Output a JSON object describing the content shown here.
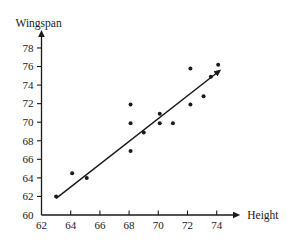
{
  "chart_data": {
    "type": "scatter",
    "title": "",
    "xlabel": "Height",
    "ylabel": "Wingspan",
    "xlim": [
      62,
      75.2
    ],
    "ylim": [
      60,
      79.3
    ],
    "xticks": [
      62,
      64,
      66,
      68,
      70,
      72,
      74
    ],
    "yticks": [
      60,
      62,
      64,
      66,
      68,
      70,
      72,
      74,
      76,
      78
    ],
    "xtick_labels": [
      "62",
      "64",
      "66",
      "68",
      "70",
      "72",
      "74"
    ],
    "ytick_labels": [
      "60",
      "62",
      "64",
      "66",
      "68",
      "70",
      "72",
      "74",
      "76",
      "78"
    ],
    "grid": false,
    "legend": null,
    "point_color": "#1a1a1a",
    "line_color": "#1a1a1a",
    "points": [
      {
        "x": 63.0,
        "y": 62.0
      },
      {
        "x": 64.1,
        "y": 64.5
      },
      {
        "x": 65.1,
        "y": 64.0
      },
      {
        "x": 68.1,
        "y": 71.9
      },
      {
        "x": 68.1,
        "y": 69.9
      },
      {
        "x": 68.1,
        "y": 66.9
      },
      {
        "x": 69.0,
        "y": 68.9
      },
      {
        "x": 70.1,
        "y": 70.9
      },
      {
        "x": 70.1,
        "y": 69.9
      },
      {
        "x": 71.0,
        "y": 69.9
      },
      {
        "x": 72.2,
        "y": 75.8
      },
      {
        "x": 72.2,
        "y": 71.9
      },
      {
        "x": 73.1,
        "y": 72.8
      },
      {
        "x": 73.6,
        "y": 74.9
      },
      {
        "x": 74.1,
        "y": 76.2
      }
    ],
    "trend_line": {
      "x_start": 63.0,
      "y_start": 61.8,
      "x_end": 74.0,
      "y_end": 75.3,
      "has_arrowhead": true
    },
    "axis_arrows": {
      "x_axis": true,
      "y_axis": true
    }
  }
}
